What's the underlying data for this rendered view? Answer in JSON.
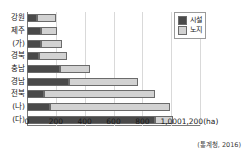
{
  "chart_data": {
    "type": "bar",
    "orientation": "horizontal",
    "stacked": true,
    "title": "",
    "xlabel": "1,200(ha)",
    "ylabel": "",
    "xlim": [
      0,
      1200
    ],
    "xticks": [
      "0",
      "200",
      "400",
      "600",
      "800",
      "1,000",
      "1,200(ha)"
    ],
    "xtick_values": [
      0,
      200,
      400,
      600,
      800,
      1000,
      1200
    ],
    "grid": true,
    "legend_position": "top-right",
    "unit": "ha",
    "source": "(통계청, 2016)",
    "categories": [
      "강원",
      "제주",
      "(가)",
      "경북",
      "충남",
      "경남",
      "전북",
      "(나)",
      "(다)"
    ],
    "series": [
      {
        "name": "시설",
        "color": "#4a4a4a",
        "values": [
          70,
          95,
          100,
          85,
          230,
          290,
          120,
          160,
          890
        ]
      },
      {
        "name": "노지",
        "color": "#d2d2d2",
        "values": [
          130,
          115,
          140,
          195,
          210,
          480,
          770,
          830,
          120
        ]
      }
    ],
    "totals": [
      200,
      210,
      240,
      280,
      440,
      770,
      890,
      990,
      1010
    ]
  },
  "legend": {
    "items": [
      {
        "label": "시설",
        "swatch": "dark-swatch"
      },
      {
        "label": "노지",
        "swatch": "light-swatch"
      }
    ]
  },
  "footer": {
    "source": "(통계청, 2016)"
  }
}
